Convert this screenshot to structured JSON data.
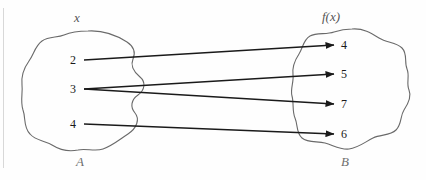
{
  "diagram": {
    "type": "mapping-diagram",
    "title_top_left": "x",
    "title_top_right": "f(x)",
    "label_bottom_left": "A",
    "label_bottom_right": "B",
    "domain_set": {
      "name": "A",
      "header": "x",
      "elements": [
        {
          "value": "2",
          "x": 72,
          "y": 60
        },
        {
          "value": "3",
          "x": 72,
          "y": 89
        },
        {
          "value": "4",
          "x": 72,
          "y": 124
        }
      ]
    },
    "codomain_set": {
      "name": "B",
      "header": "f(x)",
      "elements": [
        {
          "value": "4",
          "x": 344,
          "y": 45
        },
        {
          "value": "5",
          "x": 344,
          "y": 74
        },
        {
          "value": "7",
          "x": 344,
          "y": 104
        },
        {
          "value": "6",
          "x": 344,
          "y": 134
        }
      ]
    },
    "mappings": [
      {
        "from": "2",
        "to": "4",
        "x1": 84,
        "y1": 60,
        "x2": 334,
        "y2": 45
      },
      {
        "from": "3",
        "to": "5",
        "x1": 84,
        "y1": 89,
        "x2": 334,
        "y2": 74
      },
      {
        "from": "3",
        "to": "7",
        "x1": 84,
        "y1": 89,
        "x2": 334,
        "y2": 104
      },
      {
        "from": "4",
        "to": "6",
        "x1": 84,
        "y1": 124,
        "x2": 334,
        "y2": 134
      }
    ],
    "colors": {
      "stroke": "#1a1a1a",
      "blob_stroke": "#6a6a6a",
      "background": "#fefefe",
      "set_label": "#6f6f6f"
    }
  }
}
